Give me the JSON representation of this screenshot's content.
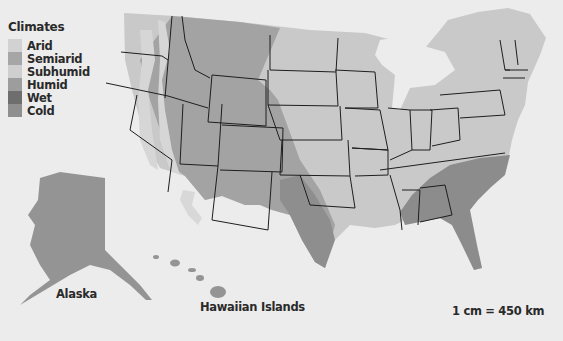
{
  "legend": {
    "title": "Climates",
    "items": [
      {
        "label": "Arid",
        "color": "#d2d2d2"
      },
      {
        "label": "Semiarid",
        "color": "#a6a6a6"
      },
      {
        "label": "Subhumid",
        "color": "#cfcfcf"
      },
      {
        "label": "Humid",
        "color": "#9d9d9d"
      },
      {
        "label": "Wet",
        "color": "#6e6e6e"
      },
      {
        "label": "Cold",
        "color": "#8f8f8f"
      }
    ]
  },
  "labels": {
    "alaska": "Alaska",
    "hawaii": "Hawaiian Islands",
    "scale": "1 cm = 450 km"
  },
  "colors": {
    "background": "#ececec",
    "lakes": "#ececec",
    "border": "#1e1e1e"
  }
}
